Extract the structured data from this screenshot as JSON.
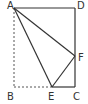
{
  "figure": {
    "type": "geometry-diagram",
    "points": {
      "A": {
        "label": "A",
        "x": 14,
        "y": 8
      },
      "D": {
        "label": "D",
        "x": 75,
        "y": 8
      },
      "F": {
        "label": "F",
        "x": 75,
        "y": 56
      },
      "C": {
        "label": "C",
        "x": 75,
        "y": 87
      },
      "E": {
        "label": "E",
        "x": 52,
        "y": 87
      },
      "B": {
        "label": "B",
        "x": 14,
        "y": 87
      }
    },
    "solid_segments": [
      "AD",
      "DC",
      "AF",
      "AE",
      "EF",
      "EC"
    ],
    "dashed_segments": [
      "AB",
      "BE"
    ],
    "colors": {
      "line": "#333333",
      "dashed": "#555555"
    }
  }
}
